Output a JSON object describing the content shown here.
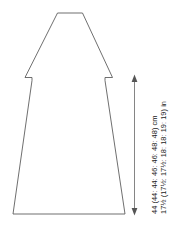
{
  "diagram": {
    "type": "knitting-pattern-schematic",
    "background_color": "#ffffff",
    "outline_color": "#555555",
    "dimension_color": "#666666",
    "text_color": "#1a1a1a"
  },
  "shape": {
    "name": "sweater-body-front",
    "description": "A-line body with shoulder slopes and armhole notches",
    "neck_width_units": 25,
    "hem_width_units": 112
  },
  "dimension": {
    "name": "body-length",
    "arrow_orientation": "vertical",
    "arrow_top_y": 76,
    "arrow_bottom_y": 214,
    "labels": {
      "cm": "44 (44: 44: 46: 46: 48: 48) cm",
      "inches": "17½ (17½: 17½: 18: 18: 19: 19) in"
    },
    "cm_values": [
      44,
      44,
      44,
      46,
      46,
      48,
      48
    ],
    "inch_values": [
      "17½",
      "17½",
      "17½",
      "18",
      "18",
      "19",
      "19"
    ],
    "size_count": 7,
    "unit_cm": "cm",
    "unit_in": "in"
  }
}
